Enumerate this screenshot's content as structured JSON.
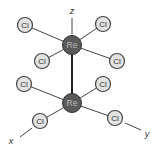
{
  "diagram": {
    "axes": [
      {
        "id": "z",
        "label": "z",
        "line": [
          72,
          18,
          72,
          34
        ],
        "tx": 72,
        "ty": 14
      },
      {
        "id": "x",
        "label": "x",
        "line": [
          20,
          137,
          32,
          128
        ],
        "tx": 11,
        "ty": 144
      },
      {
        "id": "y",
        "label": "y",
        "line": [
          125,
          123,
          141,
          130
        ],
        "tx": 147,
        "ty": 137
      }
    ],
    "metal_bond": [
      72,
      45,
      72,
      103
    ],
    "atoms": [
      {
        "id": "re-top",
        "label": "Re",
        "x": 72,
        "y": 45,
        "r": 9.5,
        "fill": "#5a5a5a",
        "text": "#bbbbbb"
      },
      {
        "id": "re-bottom",
        "label": "Re",
        "x": 72,
        "y": 103,
        "r": 9.5,
        "fill": "#5a5a5a",
        "text": "#bbbbbb"
      },
      {
        "id": "cl-1",
        "label": "Cl",
        "x": 25,
        "y": 25,
        "r": 7.5,
        "bond": "re-top"
      },
      {
        "id": "cl-2",
        "label": "Cl",
        "x": 103,
        "y": 24,
        "r": 7.5,
        "bond": "re-top"
      },
      {
        "id": "cl-3",
        "label": "Cl",
        "x": 42,
        "y": 61,
        "r": 7.5,
        "bond": "re-top"
      },
      {
        "id": "cl-4",
        "label": "Cl",
        "x": 117,
        "y": 61,
        "r": 7.5,
        "bond": "re-top"
      },
      {
        "id": "cl-5",
        "label": "Cl",
        "x": 24,
        "y": 84,
        "r": 7.5,
        "bond": "re-bottom"
      },
      {
        "id": "cl-6",
        "label": "Cl",
        "x": 103,
        "y": 84,
        "r": 7.5,
        "bond": "re-bottom"
      },
      {
        "id": "cl-7",
        "label": "Cl",
        "x": 40,
        "y": 121,
        "r": 7.5,
        "bond": "re-bottom"
      },
      {
        "id": "cl-8",
        "label": "Cl",
        "x": 115,
        "y": 118,
        "r": 7.5,
        "bond": "re-bottom"
      }
    ],
    "colors": {
      "cl_fill": "#e2e2e2",
      "cl_stroke": "#444444",
      "bond": "#444444",
      "label": "#333333"
    }
  }
}
